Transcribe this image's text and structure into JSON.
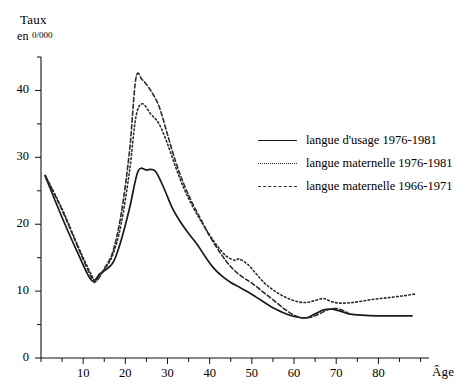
{
  "chart_data": {
    "type": "line",
    "title": "",
    "xlabel": "Âge",
    "ylabel": "Taux",
    "ylabel_unit": "en 0/000",
    "ylabel_unit_prefix": "en",
    "ylabel_unit_value": "0/000",
    "xlim": [
      0,
      92
    ],
    "ylim": [
      0,
      45
    ],
    "xticks": [
      10,
      20,
      30,
      40,
      50,
      60,
      70,
      80
    ],
    "xticklabels": [
      "10",
      "20",
      "30",
      "40",
      "50",
      "60",
      "70",
      "80"
    ],
    "xminor_step": 5,
    "yticks": [
      0,
      10,
      20,
      30,
      40
    ],
    "yticklabels": [
      "0",
      "10",
      "20",
      "30",
      "40"
    ],
    "yminor_step": 5,
    "grid": false,
    "legend_position": "upper-right-inside",
    "series": [
      {
        "name": "langue d'usage 1976-1981",
        "style": "solid",
        "color": "#1a1a1a",
        "points": [
          [
            1,
            27.2
          ],
          [
            5,
            21.0
          ],
          [
            9,
            15.3
          ],
          [
            12,
            11.6
          ],
          [
            14,
            12.6
          ],
          [
            17,
            14.2
          ],
          [
            19,
            17.6
          ],
          [
            21,
            22.4
          ],
          [
            23,
            27.9
          ],
          [
            25,
            28.1
          ],
          [
            27,
            28.0
          ],
          [
            29,
            25.6
          ],
          [
            31,
            22.6
          ],
          [
            33,
            20.4
          ],
          [
            35,
            18.6
          ],
          [
            37,
            17.0
          ],
          [
            39,
            15.1
          ],
          [
            41,
            13.4
          ],
          [
            43,
            12.2
          ],
          [
            45,
            11.3
          ],
          [
            47,
            10.6
          ],
          [
            49,
            9.9
          ],
          [
            51,
            9.1
          ],
          [
            53,
            8.3
          ],
          [
            55,
            7.5
          ],
          [
            57,
            6.9
          ],
          [
            59,
            6.4
          ],
          [
            61,
            6.1
          ],
          [
            63,
            6.0
          ],
          [
            65,
            6.6
          ],
          [
            67,
            7.2
          ],
          [
            69,
            7.3
          ],
          [
            71,
            7.0
          ],
          [
            73,
            6.6
          ],
          [
            76,
            6.4
          ],
          [
            80,
            6.3
          ],
          [
            84,
            6.3
          ],
          [
            88,
            6.3
          ]
        ]
      },
      {
        "name": "langue maternelle 1976-1981",
        "style": "dotted",
        "color": "#2b2b2b",
        "points": [
          [
            1,
            27.3
          ],
          [
            5,
            22.3
          ],
          [
            9,
            16.4
          ],
          [
            12,
            12.4
          ],
          [
            13,
            11.6
          ],
          [
            15,
            13.2
          ],
          [
            17,
            15.4
          ],
          [
            19,
            20.0
          ],
          [
            21,
            28.0
          ],
          [
            22.5,
            36.0
          ],
          [
            24,
            38.0
          ],
          [
            26,
            36.5
          ],
          [
            28,
            35.0
          ],
          [
            30,
            32.0
          ],
          [
            32,
            28.4
          ],
          [
            34,
            25.2
          ],
          [
            36,
            22.6
          ],
          [
            38,
            20.4
          ],
          [
            40,
            18.4
          ],
          [
            42,
            16.6
          ],
          [
            44,
            15.2
          ],
          [
            46,
            14.6
          ],
          [
            47,
            14.8
          ],
          [
            49,
            14.0
          ],
          [
            51,
            12.6
          ],
          [
            53,
            11.2
          ],
          [
            55,
            10.2
          ],
          [
            57,
            9.4
          ],
          [
            59,
            8.8
          ],
          [
            61,
            8.4
          ],
          [
            63,
            8.3
          ],
          [
            65,
            8.6
          ],
          [
            67,
            8.9
          ],
          [
            69,
            8.4
          ],
          [
            71,
            8.2
          ],
          [
            74,
            8.3
          ],
          [
            78,
            8.7
          ],
          [
            82,
            9.0
          ],
          [
            86,
            9.3
          ],
          [
            89,
            9.6
          ]
        ]
      },
      {
        "name": "langue maternelle 1966-1971",
        "style": "dashed",
        "color": "#2b2b2b",
        "points": [
          [
            1,
            27.3
          ],
          [
            5,
            22.1
          ],
          [
            9,
            16.2
          ],
          [
            12,
            12.0
          ],
          [
            13,
            11.4
          ],
          [
            15,
            13.4
          ],
          [
            17,
            15.8
          ],
          [
            19,
            21.5
          ],
          [
            21,
            31.0
          ],
          [
            22.5,
            41.8
          ],
          [
            24,
            41.6
          ],
          [
            26,
            40.0
          ],
          [
            28,
            37.6
          ],
          [
            30,
            33.4
          ],
          [
            32,
            29.2
          ],
          [
            34,
            25.8
          ],
          [
            36,
            23.0
          ],
          [
            38,
            20.6
          ],
          [
            40,
            18.2
          ],
          [
            42,
            16.2
          ],
          [
            44,
            14.4
          ],
          [
            46,
            13.0
          ],
          [
            48,
            12.0
          ],
          [
            50,
            11.2
          ],
          [
            52,
            10.2
          ],
          [
            54,
            9.2
          ],
          [
            56,
            8.2
          ],
          [
            58,
            7.2
          ],
          [
            60,
            6.4
          ],
          [
            62,
            6.0
          ],
          [
            64,
            6.1
          ],
          [
            66,
            6.6
          ],
          [
            68,
            7.2
          ],
          [
            70,
            7.4
          ],
          [
            72,
            7.0
          ],
          [
            73,
            6.6
          ]
        ]
      }
    ]
  }
}
